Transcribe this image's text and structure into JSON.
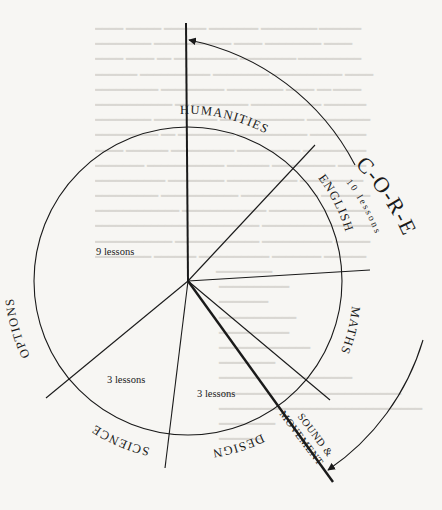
{
  "diagram": {
    "type": "curriculum-wheel",
    "center_lines": "radial segments of a circle",
    "segments": [
      {
        "name": "HUMANITIES"
      },
      {
        "name": "ENGLISH"
      },
      {
        "name": "MATHS"
      },
      {
        "name": "SOUND &",
        "name_line2": "MOVEMENT"
      },
      {
        "name": "DESIGN",
        "lessons": "3 lessons"
      },
      {
        "name": "SCIENCE",
        "lessons": "3 lessons"
      },
      {
        "name": "OPTIONS",
        "lessons": "9 lessons"
      }
    ],
    "core": {
      "label": "C-O-R-E",
      "letters": [
        "C",
        "-",
        "O",
        "-",
        "R",
        "-",
        "E"
      ],
      "lessons": "10 lessons"
    },
    "colors": {
      "ink": "#1a1a1a",
      "paper": "#f7f6f3",
      "bleed_through": "#d9d7d2"
    }
  }
}
